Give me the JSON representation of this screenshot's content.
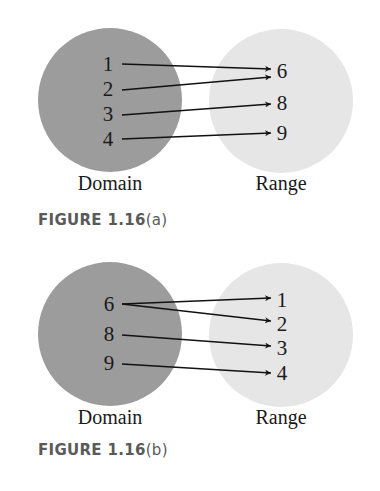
{
  "colors": {
    "domain_fill": "#9c9c9c",
    "range_fill": "#e6e6e6",
    "arrow": "#111111",
    "text": "#1a1a1a",
    "caption": "#5a5a5a",
    "background": "#ffffff"
  },
  "figures": [
    {
      "id": "a",
      "caption_prefix": "FIGURE 1.16",
      "caption_suffix": "(a)",
      "domain_label": "Domain",
      "range_label": "Range",
      "domain": [
        "1",
        "2",
        "3",
        "4"
      ],
      "range": [
        "6",
        "8",
        "9"
      ],
      "mappings": [
        {
          "from": "1",
          "to": "6"
        },
        {
          "from": "2",
          "to": "6"
        },
        {
          "from": "3",
          "to": "8"
        },
        {
          "from": "4",
          "to": "9"
        }
      ]
    },
    {
      "id": "b",
      "caption_prefix": "FIGURE 1.16",
      "caption_suffix": "(b)",
      "domain_label": "Domain",
      "range_label": "Range",
      "domain": [
        "6",
        "8",
        "9"
      ],
      "range": [
        "1",
        "2",
        "3",
        "4"
      ],
      "mappings": [
        {
          "from": "6",
          "to": "1"
        },
        {
          "from": "6",
          "to": "2"
        },
        {
          "from": "8",
          "to": "3"
        },
        {
          "from": "9",
          "to": "4"
        }
      ]
    }
  ]
}
